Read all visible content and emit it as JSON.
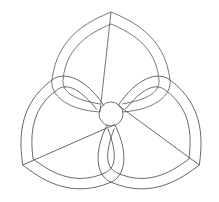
{
  "diagram": {
    "type": "trefoil-knot-line-art",
    "stroke_color": "#555555",
    "background": "#ffffff",
    "center_circle": {
      "cx": 111,
      "cy": 114,
      "r": 12
    },
    "lobes": [
      "top",
      "left",
      "right"
    ]
  }
}
